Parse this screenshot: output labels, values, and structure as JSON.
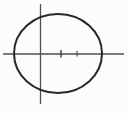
{
  "figure": {
    "background_color": "#fcfcfc",
    "canvas": {
      "width": 128,
      "height": 113,
      "viewbox": "0 0 128 113"
    },
    "axes": {
      "color": "#4f4f4f",
      "stroke_width": 1.3,
      "vertical": {
        "x1": 40.5,
        "y1": 4,
        "x2": 40.5,
        "y2": 104
      },
      "horizontal": {
        "x1": 3,
        "y1": 54,
        "x2": 124,
        "y2": 54
      }
    },
    "ellipse": {
      "cx": 58,
      "cy": 53.5,
      "rx": 44,
      "ry": 39.5,
      "stroke": "#282828",
      "stroke_width": 2,
      "fill": "none"
    },
    "ticks": {
      "items": [
        {
          "x1": 61,
          "y1": 50,
          "x2": 61,
          "y2": 57.5,
          "stroke": "#3d3d3d",
          "stroke_width": 1.4
        },
        {
          "x1": 77,
          "y1": 51,
          "x2": 77,
          "y2": 56.5,
          "stroke": "#555555",
          "stroke_width": 1.2
        }
      ]
    }
  }
}
